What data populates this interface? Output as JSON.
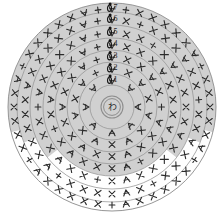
{
  "figure": {
    "kind": "crochet-round-chart",
    "width": 219,
    "height": 220,
    "center": {
      "x": 112,
      "y": 107
    },
    "background_color": "#ffffff",
    "shaded_color": "#d0d0d0",
    "unshaded_color": "#fefefe",
    "ring_line_color": "#8d8d8d",
    "symbol_color": "#2b2b2b",
    "outer_radius": 104
  },
  "center_marker": {
    "label": "わ",
    "name": "magic-ring",
    "ring_radius": 11
  },
  "round_labels": [
    {
      "label": "1",
      "radius": 22
    },
    {
      "label": "2",
      "radius": 33
    },
    {
      "label": "3",
      "radius": 45
    },
    {
      "label": "4",
      "radius": 57
    },
    {
      "label": "5",
      "radius": 69
    },
    {
      "label": "6",
      "radius": 82
    },
    {
      "label": "7",
      "radius": 95
    }
  ],
  "chart_data": {
    "type": "diagram",
    "center_symbol": "わ",
    "shading": {
      "shaded_from_angle_deg": -180,
      "shaded_to_angle_deg": 55,
      "note": "upper portion shaded grey, lower outer rounds left white"
    },
    "rounds": [
      {
        "round": 1,
        "radius": 22,
        "stitch_count": 8,
        "symbols": [
          "inc",
          "inc",
          "inc",
          "inc",
          "inc",
          "inc",
          "inc",
          "inc"
        ],
        "start_angle_deg": -90
      },
      {
        "round": 2,
        "radius": 33,
        "stitch_count": 14,
        "symbols": [
          "inc",
          "x",
          "inc",
          "x",
          "inc",
          "x",
          "inc",
          "x",
          "inc",
          "x",
          "inc",
          "x",
          "inc",
          "x"
        ],
        "start_angle_deg": -90
      },
      {
        "round": 3,
        "radius": 45,
        "stitch_count": 20,
        "symbols": [
          "inc",
          "x",
          "x",
          "inc",
          "x",
          "x",
          "inc",
          "x",
          "x",
          "inc",
          "x",
          "x",
          "inc",
          "x",
          "x",
          "inc",
          "x",
          "x",
          "inc",
          "x"
        ],
        "start_angle_deg": -90
      },
      {
        "round": 4,
        "radius": 57,
        "stitch_count": 26,
        "symbols": [
          "inc",
          "x",
          "x",
          "x",
          "inc",
          "x",
          "x",
          "x",
          "inc",
          "x",
          "x",
          "x",
          "inc",
          "x",
          "x",
          "x",
          "inc",
          "x",
          "x",
          "x",
          "inc",
          "x",
          "x",
          "x",
          "inc",
          "x"
        ],
        "start_angle_deg": -90
      },
      {
        "round": 5,
        "radius": 69,
        "stitch_count": 32,
        "symbols": [
          "inc",
          "x",
          "x",
          "x",
          "x",
          "inc",
          "x",
          "x",
          "x",
          "x",
          "inc",
          "x",
          "x",
          "x",
          "x",
          "inc",
          "x",
          "x",
          "x",
          "x",
          "inc",
          "x",
          "x",
          "x",
          "x",
          "inc",
          "x",
          "x",
          "x",
          "x",
          "inc",
          "x"
        ],
        "start_angle_deg": -90
      },
      {
        "round": 6,
        "radius": 82,
        "stitch_count": 38,
        "symbols": [
          "inc",
          "x",
          "x",
          "x",
          "x",
          "x",
          "inc",
          "x",
          "x",
          "x",
          "x",
          "x",
          "inc",
          "x",
          "x",
          "x",
          "x",
          "x",
          "inc",
          "x",
          "x",
          "x",
          "x",
          "x",
          "inc",
          "x",
          "x",
          "x",
          "x",
          "x",
          "inc",
          "x",
          "x",
          "x",
          "x",
          "x",
          "inc",
          "x"
        ],
        "start_angle_deg": -90
      },
      {
        "round": 7,
        "radius": 95,
        "stitch_count": 44,
        "symbols": [
          "inc",
          "x",
          "x",
          "x",
          "x",
          "x",
          "x",
          "inc",
          "x",
          "x",
          "x",
          "x",
          "x",
          "x",
          "inc",
          "x",
          "x",
          "x",
          "x",
          "x",
          "x",
          "inc",
          "x",
          "x",
          "x",
          "x",
          "x",
          "x",
          "inc",
          "x",
          "x",
          "x",
          "x",
          "x",
          "x",
          "inc",
          "x",
          "x",
          "x",
          "x",
          "x",
          "x",
          "inc",
          "x"
        ],
        "start_angle_deg": -90
      }
    ],
    "legend": [
      {
        "symbol": "x",
        "meaning": "single crochet"
      },
      {
        "symbol": "+",
        "meaning": "single crochet (alt)"
      },
      {
        "symbol": "inc",
        "meaning": "2 single crochet in one stitch"
      },
      {
        "symbol": "わ",
        "meaning": "magic ring"
      }
    ]
  }
}
